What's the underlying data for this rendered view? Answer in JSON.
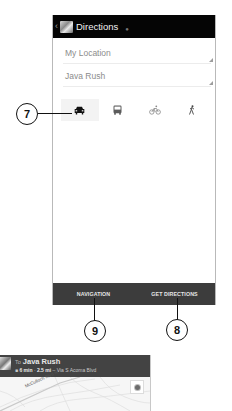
{
  "app": {
    "title": "Directions",
    "back_icon": "chevron-left-icon",
    "app_icon": "maps-app-icon"
  },
  "route": {
    "from": {
      "value": "My Location"
    },
    "to": {
      "value": "Java Rush"
    }
  },
  "modes": [
    {
      "id": "driving",
      "icon": "car-icon",
      "selected": true
    },
    {
      "id": "transit",
      "icon": "bus-icon",
      "selected": false
    },
    {
      "id": "bicycling",
      "icon": "bicycle-icon",
      "selected": false
    },
    {
      "id": "walking",
      "icon": "walking-icon",
      "selected": false
    }
  ],
  "bottom_bar": {
    "navigation_label": "NAVIGATION",
    "get_directions_label": "GET DIRECTIONS"
  },
  "callouts": {
    "mode_selector": "7",
    "get_directions": "8",
    "navigation": "9"
  },
  "navigation_preview": {
    "to_label": "To",
    "destination": "Java Rush",
    "duration": "6 min",
    "distance": "2.5 mi",
    "via": "Via S Acoma Blvd",
    "separator": "·",
    "dash": "–",
    "road_label": "McCulloch Blvd N",
    "locate_icon": "my-location-icon"
  },
  "colors": {
    "appbar": "#050505",
    "bottom_bar": "#3c3c3c",
    "selected_mode_bg": "#f3f3f3",
    "map_header": "#434343"
  }
}
